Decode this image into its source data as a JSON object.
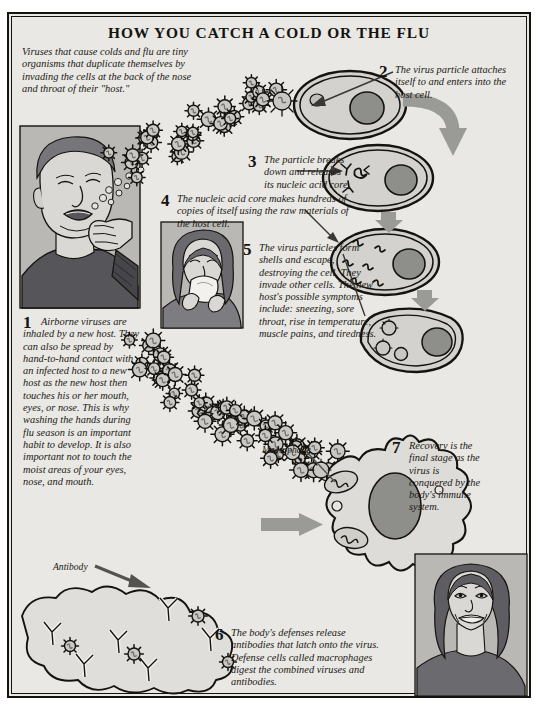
{
  "poster": {
    "title": "HOW YOU CATCH A COLD OR THE FLU",
    "intro": "Viruses that cause colds and flu are tiny organisms that duplicate themselves by invading the cells at the back of the nose and throat of their \"host.\"",
    "steps": [
      {
        "number": "1",
        "text": "Airborne viruses are inhaled by a new host. They can also be spread by hand-to-hand contact with an infected host to a new host as the new host then touches his or her mouth, eyes, or nose. This is why washing the hands during flu season is an important habit to develop. It is also important not to touch the moist areas of your eyes, nose, and mouth."
      },
      {
        "number": "2",
        "text": "The virus particle attaches itself to and enters into the host cell."
      },
      {
        "number": "3",
        "text": "The particle breaks down and releases its nucleic acid core."
      },
      {
        "number": "4",
        "text": "The nucleic acid core makes hundreds of copies of itself using the raw materials of the host cell."
      },
      {
        "number": "5",
        "text": "The virus particles form shells and escape, destroying the cell. They invade other cells. The new host's possible symptoms include: sneezing, sore throat, rise in temperature, muscle pains, and tiredness."
      },
      {
        "number": "6",
        "text": "The body's defenses release antibodies that latch onto the virus. Defense cells called macrophages digest the combined viruses and antibodies."
      },
      {
        "number": "7",
        "text": "Recovery is the final stage as the virus is conquered by the body's immune system."
      }
    ],
    "labels": {
      "macrophage": "Macrophage",
      "antibody": "Antibody"
    },
    "colors": {
      "ink": "#16130f",
      "paper": "#e9e8e4",
      "mid_gray": "#9a9a96",
      "dark_gray": "#6e6e6b",
      "light_gray": "#c6c5c1",
      "arrow_gray": "#8e8e8a",
      "skin": "#d9d8d4"
    }
  }
}
